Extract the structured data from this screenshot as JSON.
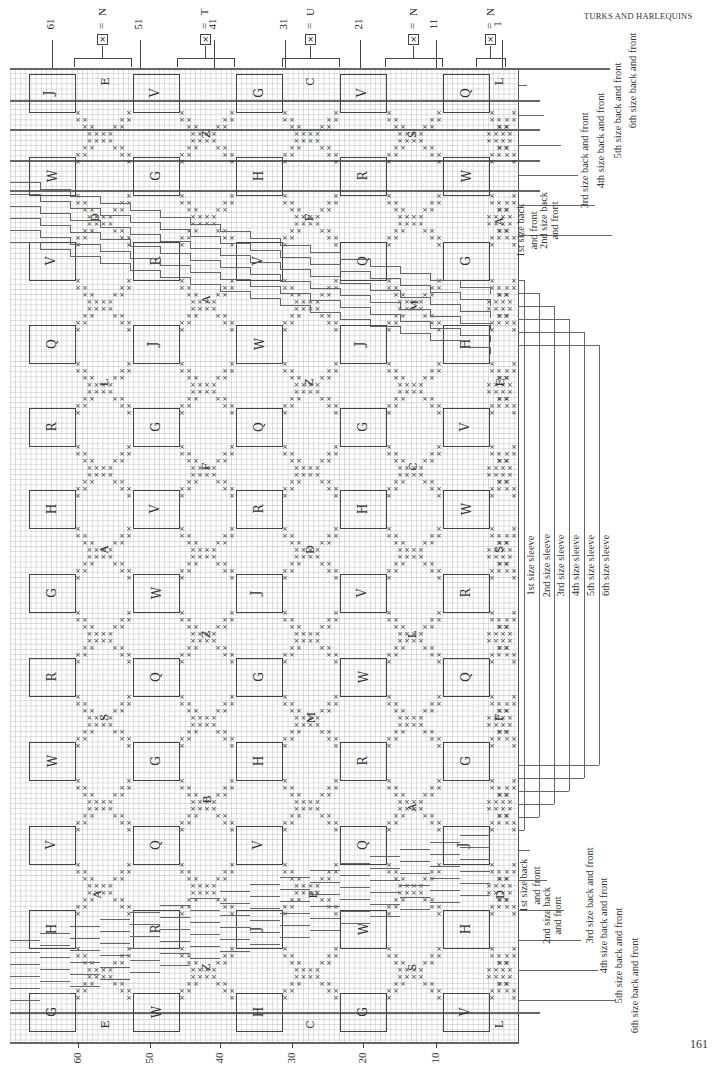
{
  "header": {
    "title": "TURKS AND HARLEQUINS"
  },
  "page_number": "161",
  "top_axis": {
    "row_labels": [
      {
        "label": "61",
        "x": 52
      },
      {
        "label": "51",
        "x": 140
      },
      {
        "label": "41",
        "x": 214
      },
      {
        "label": "31",
        "x": 285
      },
      {
        "label": "21",
        "x": 360
      },
      {
        "label": "11",
        "x": 436
      },
      {
        "label": "1",
        "x": 502
      }
    ],
    "color_keys": [
      {
        "symbol": "×",
        "equals": "=",
        "color": "N",
        "x": 102
      },
      {
        "symbol": "×",
        "equals": "=",
        "color": "T",
        "x": 205
      },
      {
        "symbol": "×",
        "equals": "=",
        "color": "U",
        "x": 310
      },
      {
        "symbol": "×",
        "equals": "=",
        "color": "N",
        "x": 413
      },
      {
        "symbol": "×",
        "equals": "=",
        "color": "N",
        "x": 490
      }
    ]
  },
  "bottom_axis": {
    "stitch_labels": [
      {
        "label": "60",
        "y": 1042
      },
      {
        "label": "50",
        "y": 1042
      },
      {
        "label": "40",
        "y": 1042
      },
      {
        "label": "30",
        "y": 1042
      },
      {
        "label": "20",
        "y": 1042
      },
      {
        "label": "10",
        "y": 1042
      }
    ]
  },
  "box_grid": {
    "columns_x": [
      29,
      133,
      236,
      340,
      443
    ],
    "rows": [
      {
        "y": 74,
        "letters": [
          "J",
          "V",
          "G",
          "V",
          "Q"
        ]
      },
      {
        "y": 157,
        "letters": [
          "W",
          "G",
          "H",
          "R",
          "W"
        ]
      },
      {
        "y": 242,
        "letters": [
          "V",
          "R",
          "V",
          "Q",
          "G"
        ]
      },
      {
        "y": 325,
        "letters": [
          "Q",
          "J",
          "W",
          "J",
          "H"
        ]
      },
      {
        "y": 408,
        "letters": [
          "R",
          "G",
          "Q",
          "G",
          "V"
        ]
      },
      {
        "y": 490,
        "letters": [
          "H",
          "V",
          "R",
          "H",
          "W"
        ]
      },
      {
        "y": 574,
        "letters": [
          "G",
          "W",
          "J",
          "V",
          "R"
        ]
      },
      {
        "y": 658,
        "letters": [
          "R",
          "Q",
          "G",
          "W",
          "Q"
        ]
      },
      {
        "y": 742,
        "letters": [
          "W",
          "G",
          "H",
          "R",
          "G"
        ]
      },
      {
        "y": 826,
        "letters": [
          "V",
          "Q",
          "V",
          "Q",
          "J"
        ]
      },
      {
        "y": 910,
        "letters": [
          "H",
          "R",
          "J",
          "W",
          "H"
        ]
      },
      {
        "y": 993,
        "letters": [
          "G",
          "W",
          "H",
          "G",
          "V"
        ]
      }
    ]
  },
  "diamond_letters": [
    {
      "letter": "E",
      "x": 105,
      "y": 82
    },
    {
      "letter": "C",
      "x": 310,
      "y": 82
    },
    {
      "letter": "L",
      "x": 500,
      "y": 82
    },
    {
      "letter": "Z",
      "x": 207,
      "y": 135
    },
    {
      "letter": "S",
      "x": 413,
      "y": 135
    },
    {
      "letter": "D",
      "x": 95,
      "y": 218
    },
    {
      "letter": "F",
      "x": 310,
      "y": 218
    },
    {
      "letter": "A",
      "x": 500,
      "y": 222
    },
    {
      "letter": "A",
      "x": 207,
      "y": 300
    },
    {
      "letter": "M",
      "x": 413,
      "y": 306
    },
    {
      "letter": "L",
      "x": 105,
      "y": 383
    },
    {
      "letter": "Z",
      "x": 310,
      "y": 383
    },
    {
      "letter": "E",
      "x": 500,
      "y": 383
    },
    {
      "letter": "F",
      "x": 207,
      "y": 467
    },
    {
      "letter": "C",
      "x": 413,
      "y": 467
    },
    {
      "letter": "A",
      "x": 105,
      "y": 550
    },
    {
      "letter": "D",
      "x": 310,
      "y": 550
    },
    {
      "letter": "S",
      "x": 500,
      "y": 550
    },
    {
      "letter": "Z",
      "x": 207,
      "y": 635
    },
    {
      "letter": "L",
      "x": 413,
      "y": 635
    },
    {
      "letter": "S",
      "x": 105,
      "y": 718
    },
    {
      "letter": "M",
      "x": 310,
      "y": 718
    },
    {
      "letter": "F",
      "x": 500,
      "y": 718
    },
    {
      "letter": "B",
      "x": 207,
      "y": 800
    },
    {
      "letter": "A",
      "x": 413,
      "y": 808
    },
    {
      "letter": "A",
      "x": 98,
      "y": 895
    },
    {
      "letter": "E",
      "x": 313,
      "y": 895
    },
    {
      "letter": "D",
      "x": 500,
      "y": 895
    },
    {
      "letter": "Z",
      "x": 207,
      "y": 968
    },
    {
      "letter": "S",
      "x": 413,
      "y": 968
    },
    {
      "letter": "E",
      "x": 105,
      "y": 1025
    },
    {
      "letter": "C",
      "x": 310,
      "y": 1025
    },
    {
      "letter": "L",
      "x": 500,
      "y": 1025
    }
  ],
  "size_labels_top": [
    {
      "label": "1st size back",
      "label2": "and front",
      "x": 524,
      "y": 230
    },
    {
      "label": "2nd size back",
      "label2": "and front",
      "x": 545,
      "y": 220
    },
    {
      "label": "3rd size back and front",
      "x": 566,
      "y": 160
    },
    {
      "label": "4th size back and front",
      "x": 583,
      "y": 140
    },
    {
      "label": "5th size back and front",
      "x": 600,
      "y": 110
    },
    {
      "label": "6th size back and front",
      "x": 615,
      "y": 80
    }
  ],
  "sleeve_labels": [
    {
      "label": "1st size sleeve",
      "x": 532
    },
    {
      "label": "2nd size sleeve",
      "x": 547
    },
    {
      "label": "3rd size sleeve",
      "x": 562
    },
    {
      "label": "4th size sleeve",
      "x": 577
    },
    {
      "label": "5th size sleeve",
      "x": 592
    },
    {
      "label": "6th size sleeve",
      "x": 607
    }
  ],
  "size_labels_bottom": [
    {
      "label": "1st size back",
      "label2": "and front",
      "x": 527,
      "y": 820
    },
    {
      "label": "2nd size back",
      "label2": "and front",
      "x": 548,
      "y": 850
    },
    {
      "label": "3rd size back and front",
      "x": 571,
      "y": 830
    },
    {
      "label": "4th size back and front",
      "x": 586,
      "y": 860
    },
    {
      "label": "5th size back and front",
      "x": 601,
      "y": 890
    },
    {
      "label": "6th size back and front",
      "x": 617,
      "y": 920
    }
  ]
}
